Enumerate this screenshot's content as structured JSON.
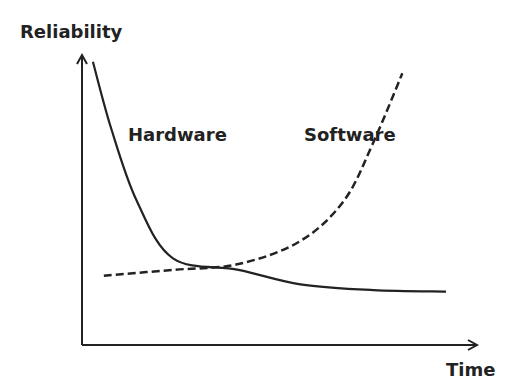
{
  "chart_data": {
    "type": "line",
    "title": "",
    "xlabel": "Time",
    "ylabel": "Reliability",
    "grid": false,
    "legend": "none",
    "series": [
      {
        "name": "Hardware",
        "style": "solid",
        "trend": "decreasing exponentially from high to a low plateau",
        "points": [
          [
            0.03,
            0.98
          ],
          [
            0.08,
            0.75
          ],
          [
            0.15,
            0.5
          ],
          [
            0.25,
            0.3
          ],
          [
            0.43,
            0.26
          ],
          [
            0.6,
            0.21
          ],
          [
            0.8,
            0.19
          ],
          [
            1.0,
            0.185
          ]
        ]
      },
      {
        "name": "Software",
        "style": "dashed",
        "trend": "slowly increasing then rising sharply",
        "points": [
          [
            0.06,
            0.24
          ],
          [
            0.25,
            0.26
          ],
          [
            0.43,
            0.28
          ],
          [
            0.6,
            0.36
          ],
          [
            0.72,
            0.5
          ],
          [
            0.8,
            0.7
          ],
          [
            0.88,
            0.94
          ]
        ]
      }
    ],
    "annotations": [
      "Hardware",
      "Software"
    ],
    "colors": {
      "line": "#222222",
      "background": "#ffffff"
    }
  }
}
